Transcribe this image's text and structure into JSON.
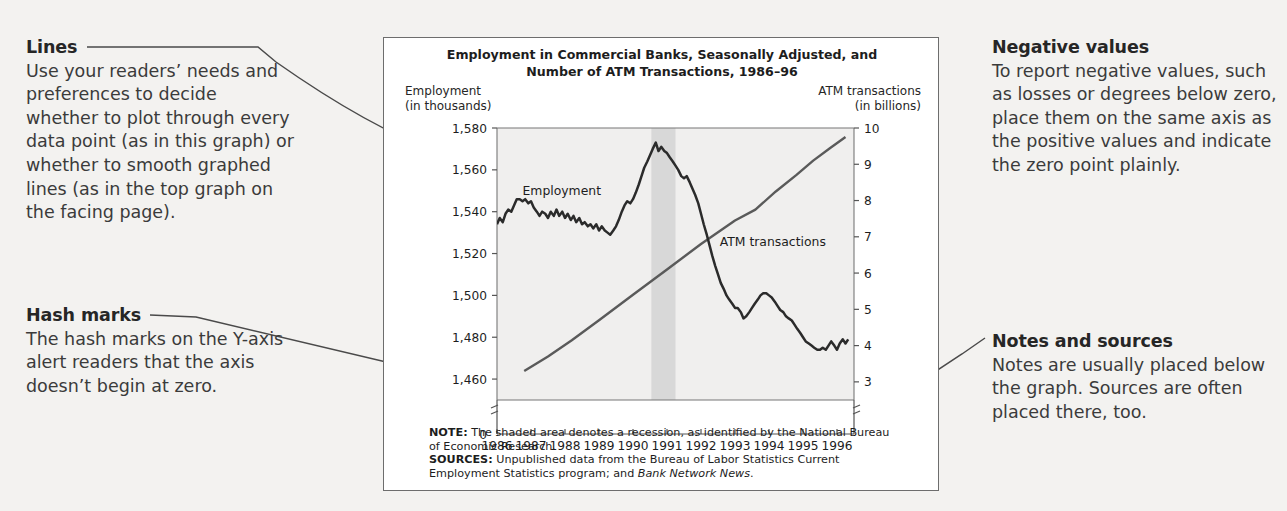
{
  "notes_left": [
    {
      "id": "lines",
      "heading": "Lines",
      "body": "Use your readers’ needs and preferences to decide whether to plot through every data point (as in this graph) or whether to smooth graphed lines (as in the top graph on the facing page)."
    },
    {
      "id": "hash-marks",
      "heading": "Hash marks",
      "body": "The hash marks on the Y-axis alert readers that the axis doesn’t begin at zero."
    }
  ],
  "notes_right": [
    {
      "id": "negative-values",
      "heading": "Negative values",
      "body": "To report negative values, such as losses or degrees below zero, place them on the same axis as the positive values and indicate the zero point plainly."
    },
    {
      "id": "notes-and-sources",
      "heading": "Notes and sources",
      "body": "Notes are usually placed below the graph. Sources are often placed there, too."
    }
  ],
  "figure": {
    "title_line1": "Employment in Commercial Banks, Seasonally Adjusted, and",
    "title_line2": "Number of ATM Transactions, 1986–96",
    "left_axis_caption_line1": "Employment",
    "left_axis_caption_line2": "(in thousands)",
    "right_axis_caption_line1": "ATM transactions",
    "right_axis_caption_line2": "(in billions)",
    "note_label": "NOTE:",
    "note_text": " The shaded area denotes a recession, as identified by the National Bureau of Economic Research.",
    "sources_label": "SOURCES:",
    "sources_text_part1": " Unpublished data from the Bureau of Labor Statistics Current Employment Statistics program; and ",
    "sources_italic": "Bank Network News",
    "sources_text_part2": "."
  },
  "chart_data": {
    "type": "line",
    "title": "Employment in Commercial Banks, Seasonally Adjusted, and Number of ATM Transactions, 1986–96",
    "xlabel": "",
    "xlim": [
      1986,
      1996.5
    ],
    "xticks": [
      1986,
      1987,
      1988,
      1989,
      1990,
      1991,
      1992,
      1993,
      1994,
      1995,
      1996
    ],
    "xtick_labels": [
      "1986",
      "1987",
      "1988",
      "1989",
      "1990",
      "1991",
      "1992",
      "1993",
      "1994",
      "1995",
      "1996"
    ],
    "grid": false,
    "legend_position": "inline-labels",
    "axis_break_marker": "hash marks below lowest tick on both y-axes",
    "zero_label": "0",
    "shaded_region": {
      "label": "recession",
      "x_start": 1990.54,
      "x_end": 1991.25,
      "color": "#d8d8d8"
    },
    "series": [
      {
        "name": "Employment",
        "inline_label": "Employment",
        "axis": "left",
        "ylabel": "Employment (in thousands)",
        "ylim": [
          1450,
          1580
        ],
        "yticks": [
          1460,
          1480,
          1500,
          1520,
          1540,
          1560,
          1580
        ],
        "ytick_labels": [
          "1,460",
          "1,480",
          "1,500",
          "1,520",
          "1,540",
          "1,560",
          "1,580"
        ],
        "color": "#2b2b2b",
        "x": [
          1986.0,
          1986.08,
          1986.17,
          1986.25,
          1986.33,
          1986.42,
          1986.5,
          1986.58,
          1986.67,
          1986.75,
          1986.83,
          1986.92,
          1987.0,
          1987.08,
          1987.17,
          1987.25,
          1987.33,
          1987.42,
          1987.5,
          1987.58,
          1987.67,
          1987.75,
          1987.83,
          1987.92,
          1988.0,
          1988.08,
          1988.17,
          1988.25,
          1988.33,
          1988.42,
          1988.5,
          1988.58,
          1988.67,
          1988.75,
          1988.83,
          1988.92,
          1989.0,
          1989.08,
          1989.17,
          1989.25,
          1989.33,
          1989.42,
          1989.5,
          1989.58,
          1989.67,
          1989.75,
          1989.83,
          1989.92,
          1990.0,
          1990.08,
          1990.17,
          1990.25,
          1990.33,
          1990.42,
          1990.5,
          1990.58,
          1990.67,
          1990.75,
          1990.83,
          1990.92,
          1991.0,
          1991.08,
          1991.17,
          1991.25,
          1991.33,
          1991.42,
          1991.5,
          1991.58,
          1991.67,
          1991.75,
          1991.83,
          1991.92,
          1992.0,
          1992.08,
          1992.17,
          1992.25,
          1992.33,
          1992.42,
          1992.5,
          1992.58,
          1992.67,
          1992.75,
          1992.83,
          1992.92,
          1993.0,
          1993.08,
          1993.17,
          1993.25,
          1993.33,
          1993.42,
          1993.5,
          1993.58,
          1993.67,
          1993.75,
          1993.83,
          1993.92,
          1994.0,
          1994.08,
          1994.17,
          1994.25,
          1994.33,
          1994.42,
          1994.5,
          1994.58,
          1994.67,
          1994.75,
          1994.83,
          1994.92,
          1995.0,
          1995.08,
          1995.17,
          1995.25,
          1995.33,
          1995.42,
          1995.5,
          1995.58,
          1995.67,
          1995.75,
          1995.83,
          1995.92,
          1996.0,
          1996.08,
          1996.17,
          1996.25,
          1996.33
        ],
        "y": [
          1534,
          1537,
          1535,
          1539,
          1541,
          1540,
          1543,
          1546,
          1546,
          1545,
          1546,
          1544,
          1545,
          1542,
          1540,
          1538,
          1540,
          1539,
          1537,
          1540,
          1538,
          1541,
          1538,
          1540,
          1537,
          1539,
          1536,
          1538,
          1535,
          1537,
          1534,
          1535,
          1533,
          1534,
          1532,
          1534,
          1531,
          1533,
          1531,
          1530,
          1529,
          1531,
          1533,
          1536,
          1540,
          1543,
          1545,
          1544,
          1546,
          1549,
          1553,
          1557,
          1561,
          1564,
          1567,
          1570,
          1573,
          1569,
          1571,
          1569,
          1568,
          1566,
          1564,
          1562,
          1560,
          1557,
          1556,
          1557,
          1554,
          1551,
          1548,
          1544,
          1539,
          1534,
          1529,
          1524,
          1519,
          1514,
          1510,
          1506,
          1503,
          1500,
          1498,
          1496,
          1494,
          1494,
          1492,
          1489,
          1490,
          1492,
          1494,
          1496,
          1498,
          1500,
          1501,
          1501,
          1500,
          1499,
          1497,
          1495,
          1493,
          1492,
          1490,
          1489,
          1488,
          1486,
          1484,
          1482,
          1480,
          1478,
          1477,
          1476,
          1475,
          1474,
          1474,
          1475,
          1474,
          1476,
          1478,
          1476,
          1474,
          1477,
          1479,
          1477,
          1479
        ]
      },
      {
        "name": "ATM transactions",
        "inline_label": "ATM transactions",
        "axis": "right",
        "ylabel": "ATM transactions (in billions)",
        "ylim": [
          2.5,
          10
        ],
        "yticks": [
          3,
          4,
          5,
          6,
          7,
          8,
          9,
          10
        ],
        "ytick_labels": [
          "3",
          "4",
          "5",
          "6",
          "7",
          "8",
          "9",
          "10"
        ],
        "color": "#5a5a5a",
        "x": [
          1986.8,
          1987.5,
          1988.2,
          1989.0,
          1990.0,
          1991.0,
          1992.0,
          1993.0,
          1993.6,
          1994.2,
          1994.8,
          1995.3,
          1995.8,
          1996.25
        ],
        "y": [
          3.3,
          3.7,
          4.15,
          4.7,
          5.4,
          6.1,
          6.8,
          7.45,
          7.75,
          8.25,
          8.7,
          9.1,
          9.45,
          9.75
        ]
      }
    ]
  }
}
